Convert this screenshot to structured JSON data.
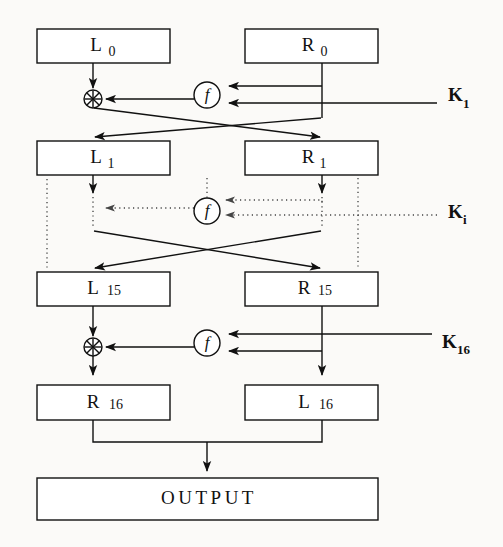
{
  "diagram": {
    "background_color": "#fbfaf8",
    "line_color": "#111111",
    "dotted_line_color": "#444444",
    "boxes": [
      {
        "id": "L0",
        "base": "L",
        "sub": "0",
        "x": 37,
        "y": 29,
        "w": 133,
        "h": 34
      },
      {
        "id": "R0",
        "base": "R",
        "sub": "0",
        "x": 245,
        "y": 29,
        "w": 133,
        "h": 34
      },
      {
        "id": "L1",
        "base": "L",
        "sub": "1",
        "x": 37,
        "y": 141,
        "w": 133,
        "h": 34
      },
      {
        "id": "R1",
        "base": "R",
        "sub": "1",
        "x": 245,
        "y": 141,
        "w": 133,
        "h": 34
      },
      {
        "id": "L15",
        "base": "L",
        "sub": "15",
        "x": 37,
        "y": 272,
        "w": 133,
        "h": 34
      },
      {
        "id": "R15",
        "base": "R",
        "sub": "15",
        "x": 245,
        "y": 272,
        "w": 133,
        "h": 34
      },
      {
        "id": "R16",
        "base": "R",
        "sub": "16",
        "x": 37,
        "y": 385,
        "w": 133,
        "h": 35
      },
      {
        "id": "L16",
        "base": "L",
        "sub": "16",
        "x": 245,
        "y": 385,
        "w": 133,
        "h": 35
      }
    ],
    "output_box": {
      "label": "OUTPUT",
      "x": 37,
      "y": 478,
      "w": 341,
      "h": 42
    },
    "round_functions": [
      {
        "id": "f-round-1",
        "label": "f",
        "cx": 207,
        "cy": 95,
        "r": 13,
        "style": "solid"
      },
      {
        "id": "f-round-i",
        "label": "f",
        "cx": 207,
        "cy": 211,
        "r": 13,
        "style": "dotted"
      },
      {
        "id": "f-round-16",
        "label": "f",
        "cx": 207,
        "cy": 343,
        "r": 13,
        "style": "solid"
      }
    ],
    "xor_nodes": [
      {
        "id": "xor-round-1",
        "cx": 93,
        "cy": 99,
        "r": 9,
        "style": "solid"
      },
      {
        "id": "xor-round-16",
        "cx": 93,
        "cy": 347,
        "r": 9,
        "style": "solid"
      }
    ],
    "keys": [
      {
        "id": "K1",
        "base": "K",
        "sub": "1",
        "x": 448,
        "y": 98,
        "style": "solid",
        "line_from_x": 378,
        "line_to_x": 437
      },
      {
        "id": "Ki",
        "base": "K",
        "sub": "i",
        "x": 448,
        "y": 215,
        "style": "dotted",
        "line_from_x": 330,
        "line_to_x": 437
      },
      {
        "id": "K16",
        "base": "K",
        "sub": "16",
        "x": 442,
        "y": 345,
        "style": "solid",
        "line_from_x": 378,
        "line_to_x": 432
      }
    ],
    "ellipsis_columns": [
      {
        "id": "dots-far-left",
        "x": 47,
        "y1": 179,
        "y2": 268
      },
      {
        "id": "dots-mid-left",
        "x": 158,
        "y1": 179,
        "y2": 200
      },
      {
        "id": "dots-center",
        "x": 207,
        "y1": 178,
        "y2": 198
      },
      {
        "id": "dots-far-right",
        "x": 358,
        "y1": 178,
        "y2": 268
      }
    ]
  }
}
